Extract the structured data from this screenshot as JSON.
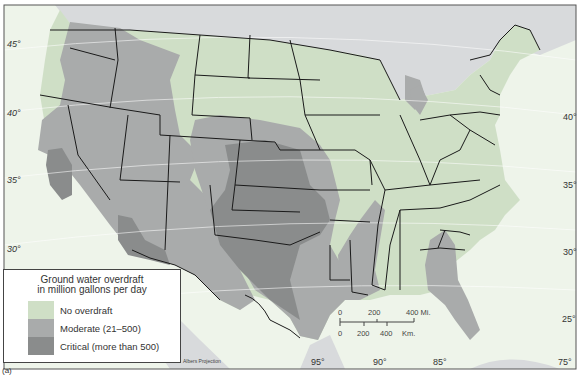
{
  "legend": {
    "title_line1": "Ground water overdraft",
    "title_line2": "in million gallons per day",
    "items": [
      {
        "label": "No overdraft",
        "color": "#cfdfc6"
      },
      {
        "label": "Moderate (21–500)",
        "color": "#a9abab"
      },
      {
        "label": "Critical (more than 500)",
        "color": "#8a8c8c"
      }
    ]
  },
  "colors": {
    "ocean": "#eef4ea",
    "foreign_land": "#d8dadc",
    "border": "#1a1a1a"
  },
  "latitude_labels_west": [
    "45°",
    "40°",
    "35°",
    "30°"
  ],
  "latitude_labels_east": [
    "40°",
    "35°",
    "30°",
    "25°"
  ],
  "longitude_labels": [
    "95°",
    "90°",
    "85°",
    "75°"
  ],
  "scale": {
    "miles_ticks": [
      "0",
      "200",
      "400 Mi."
    ],
    "km_ticks": [
      "0",
      "200",
      "400",
      "Km."
    ]
  },
  "projection": "Albers Projection",
  "figure_label": "(a)"
}
